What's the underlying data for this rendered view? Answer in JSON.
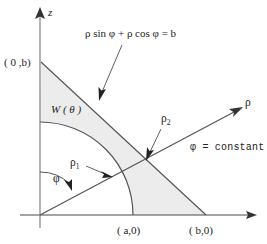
{
  "figure": {
    "title": "",
    "axes": {
      "vertical_label": "z",
      "horizontal_label": "ρ"
    },
    "labels": {
      "point_0b": "( 0 ,b)",
      "point_a0": "( a,0)",
      "point_b0": "( b,0)",
      "region": "W ( θ )",
      "rho_1_base": "ρ",
      "rho_1_sub": "1",
      "rho_2_base": "ρ",
      "rho_2_sub": "2",
      "phi_angle": "φ",
      "phi_constant": "φ = constant",
      "line_equation": "ρ sin φ +  ρ cos φ = b"
    },
    "colors": {
      "ink": "#222222",
      "axis": "#4a4a4a",
      "shade": "#ececec",
      "background": "#ffffff"
    },
    "geometry": {
      "origin": [
        40,
        215
      ],
      "x_axis_end": [
        257,
        215
      ],
      "z_axis_top": [
        40,
        10
      ],
      "b_on_z": [
        41,
        62
      ],
      "b_on_x": [
        205,
        215
      ],
      "a_on_x": [
        133,
        215
      ],
      "arc_radius": 93,
      "rho_ray_end": [
        241,
        108
      ],
      "rho_ray_angle_deg": 28,
      "intersection_rho2": [
        148,
        162
      ]
    }
  }
}
